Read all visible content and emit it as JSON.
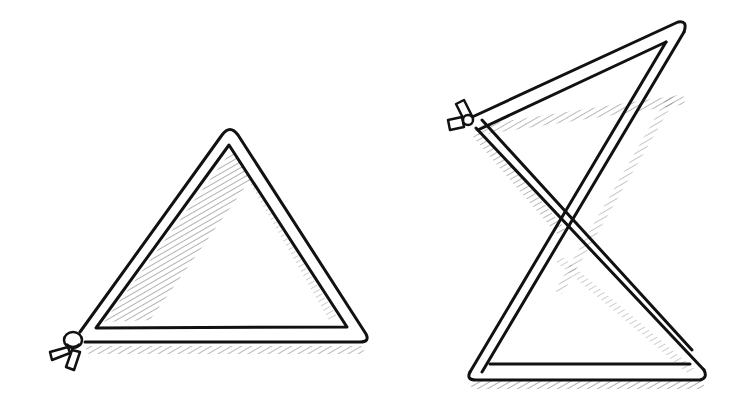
{
  "illustration": {
    "description": "Two pen-and-ink drawings of rod frames: a flat triangle tied at one corner, and a twisted figure-eight frame tied at one corner",
    "colors": {
      "ink": "#111111",
      "paper": "#ffffff"
    },
    "triangle_left": {
      "outer": [
        [
          230,
          130
        ],
        [
          368,
          340
        ],
        [
          70,
          340
        ]
      ],
      "inner": [
        [
          230,
          148
        ],
        [
          348,
          328
        ],
        [
          96,
          328
        ]
      ],
      "knot": {
        "x": 70,
        "y": 345
      }
    },
    "hourglass_right": {
      "top_bar": [
        [
          470,
          122
        ],
        [
          680,
          30
        ]
      ],
      "knot": {
        "x": 458,
        "y": 118
      },
      "crossing": {
        "x": 565,
        "y": 235
      }
    }
  }
}
